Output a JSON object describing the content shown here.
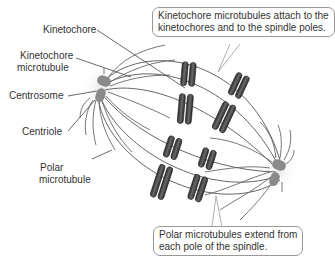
{
  "diagram": {
    "labels": {
      "kinetochore": "Kinetochore",
      "kinetochore_microtubule_1": "Kinetochore",
      "kinetochore_microtubule_2": "microtubule",
      "centrosome": "Centrosome",
      "centriole": "Centriole",
      "polar_microtubule_1": "Polar",
      "polar_microtubule_2": "microtubule"
    },
    "callouts": {
      "top_line1": "Kinetochore microtubules attach to the",
      "top_line2": "kinetochores and to the spindle poles.",
      "bottom_line1": "Polar microtubules extend from",
      "bottom_line2": "each pole of the spindle."
    },
    "colors": {
      "chromosome": "#3a3a3a",
      "microtubule": "#555555",
      "centriole": "#8a8a8a",
      "callout_border": "#999999"
    }
  }
}
